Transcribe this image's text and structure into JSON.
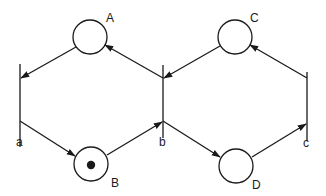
{
  "diagram": {
    "type": "petri-net",
    "stroke_color": "#1a1a1a",
    "background": "#ffffff",
    "places": [
      {
        "id": "A",
        "label": "A",
        "tokens": 0
      },
      {
        "id": "B",
        "label": "B",
        "tokens": 1
      },
      {
        "id": "C",
        "label": "C",
        "tokens": 0
      },
      {
        "id": "D",
        "label": "D",
        "tokens": 0
      }
    ],
    "transitions": [
      {
        "id": "a",
        "label": "a"
      },
      {
        "id": "b",
        "label": "b"
      },
      {
        "id": "c",
        "label": "c"
      }
    ],
    "arcs": [
      {
        "from": "A",
        "to": "a"
      },
      {
        "from": "a",
        "to": "B"
      },
      {
        "from": "B",
        "to": "b"
      },
      {
        "from": "b",
        "to": "A"
      },
      {
        "from": "C",
        "to": "b"
      },
      {
        "from": "b",
        "to": "D"
      },
      {
        "from": "D",
        "to": "c"
      },
      {
        "from": "c",
        "to": "C"
      }
    ]
  }
}
